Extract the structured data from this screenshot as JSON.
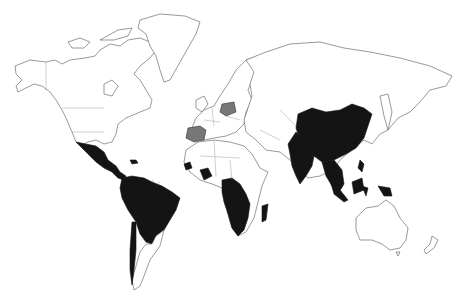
{
  "map": {
    "type": "choropleth-world",
    "colors": {
      "background": "#ffffff",
      "outline": "#555555",
      "category_dark": "#141414",
      "category_grey": "#777777",
      "unshaded": "#ffffff"
    },
    "dark_regions": [
      "Mexico",
      "Central America",
      "Colombia",
      "Venezuela",
      "Brazil",
      "Peru",
      "Bolivia",
      "Paraguay",
      "Chile",
      "West Africa (Guinea)",
      "Ivory Coast",
      "Cameroon",
      "DR Congo",
      "Angola",
      "Zambia",
      "Mozambique",
      "Zimbabwe",
      "South Africa",
      "Madagascar",
      "India",
      "China",
      "Myanmar",
      "Thailand",
      "Laos",
      "Vietnam",
      "Sumatra",
      "Borneo",
      "Sulawesi",
      "Papua New Guinea",
      "Philippines",
      "Caribbean islands"
    ],
    "grey_regions": [
      "Spain",
      "Poland"
    ]
  }
}
